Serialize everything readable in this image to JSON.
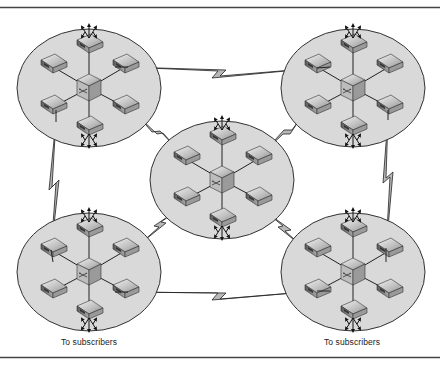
{
  "diagram": {
    "type": "network-topology",
    "colors": {
      "cluster_fill": "#d9d9d9",
      "cluster_stroke": "#333333",
      "link_fill": "#b8b8b8",
      "device_top": "#cfcfcf",
      "device_side": "#8a8a8a",
      "rule": "#444444"
    },
    "clusters": [
      {
        "id": "top-left",
        "cx": 89,
        "cy": 88,
        "arrows": [
          "top",
          "bottom"
        ]
      },
      {
        "id": "top-right",
        "cx": 353,
        "cy": 88,
        "arrows": [
          "top",
          "bottom"
        ]
      },
      {
        "id": "center",
        "cx": 222,
        "cy": 180,
        "arrows": [
          "top",
          "bottom"
        ]
      },
      {
        "id": "bottom-left",
        "cx": 89,
        "cy": 272,
        "arrows": [
          "top",
          "bottom"
        ]
      },
      {
        "id": "bottom-right",
        "cx": 353,
        "cy": 272,
        "arrows": [
          "top",
          "bottom"
        ]
      }
    ],
    "links": [
      {
        "from": "top-left",
        "to": "top-right",
        "icon": "lightning-link"
      },
      {
        "from": "top-left",
        "to": "bottom-left",
        "icon": "lightning-link"
      },
      {
        "from": "top-right",
        "to": "bottom-right",
        "icon": "lightning-link"
      },
      {
        "from": "bottom-left",
        "to": "bottom-right",
        "icon": "lightning-link"
      },
      {
        "from": "top-left",
        "to": "center",
        "icon": "lightning-link"
      },
      {
        "from": "top-right",
        "to": "center",
        "icon": "lightning-link"
      },
      {
        "from": "bottom-left",
        "to": "center",
        "icon": "lightning-link"
      },
      {
        "from": "bottom-right",
        "to": "center",
        "icon": "lightning-link"
      }
    ],
    "labels": {
      "bottom_left_caption": "To subscribers",
      "bottom_right_caption": "To subscribers"
    },
    "icons": {
      "hub": "switch-hub-icon",
      "node": "network-device-icon",
      "arrow": "subscriber-arrow-icon",
      "link": "lightning-link-icon"
    }
  }
}
